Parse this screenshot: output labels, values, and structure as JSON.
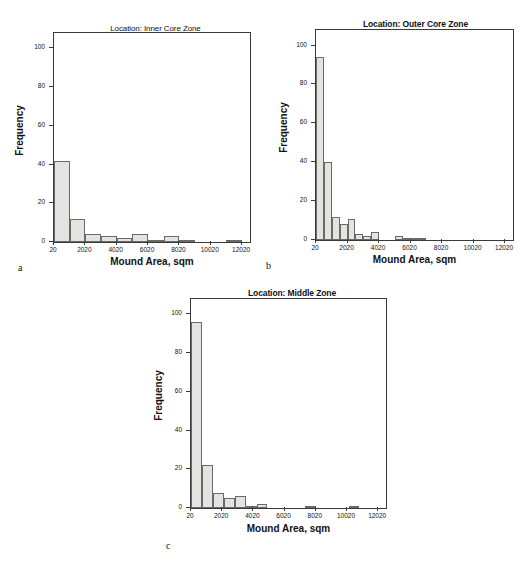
{
  "figure": {
    "axis_labels": {
      "x": "Mound Area, sqm",
      "y": "Frequency"
    },
    "panel_letters": {
      "a": "a",
      "b": "b",
      "c": "c"
    }
  },
  "chart_data": [
    {
      "type": "bar",
      "panel": "a",
      "title": "Location: Inner Core Zone",
      "xlabel": "Mound Area, sqm",
      "ylabel": "Frequency",
      "xlim": [
        20,
        12520
      ],
      "ylim": [
        0,
        108
      ],
      "xticks": [
        20,
        2020,
        4020,
        6020,
        8020,
        10020,
        12020
      ],
      "xtick_labels": [
        "20",
        "2020",
        "4020",
        "6020",
        "8020",
        "10020",
        "12020"
      ],
      "yticks": [
        0,
        20,
        40,
        60,
        80,
        100
      ],
      "ytick_labels": [
        "0",
        "20",
        "40",
        "60",
        "80",
        "100"
      ],
      "grid": false,
      "legend": "none",
      "bin_width": 1000,
      "bins": [
        {
          "x0": 20,
          "x1": 1020,
          "value": 42
        },
        {
          "x0": 1020,
          "x1": 2020,
          "value": 12
        },
        {
          "x0": 2020,
          "x1": 3020,
          "value": 4
        },
        {
          "x0": 3020,
          "x1": 4020,
          "value": 3
        },
        {
          "x0": 4020,
          "x1": 5020,
          "value": 2
        },
        {
          "x0": 5020,
          "x1": 6020,
          "value": 4
        },
        {
          "x0": 6020,
          "x1": 7020,
          "value": 1
        },
        {
          "x0": 7020,
          "x1": 8020,
          "value": 3
        },
        {
          "x0": 8020,
          "x1": 9020,
          "value": 1
        },
        {
          "x0": 9020,
          "x1": 10020,
          "value": 0
        },
        {
          "x0": 10020,
          "x1": 11020,
          "value": 0
        },
        {
          "x0": 11020,
          "x1": 12020,
          "value": 1
        }
      ]
    },
    {
      "type": "bar",
      "panel": "b",
      "title": "Location: Outer Core Zone",
      "xlabel": "Mound Area, sqm",
      "ylabel": "Frequency",
      "xlim": [
        20,
        12520
      ],
      "ylim": [
        0,
        108
      ],
      "xticks": [
        20,
        2020,
        4020,
        6020,
        8020,
        10020,
        12020
      ],
      "xtick_labels": [
        "20",
        "2020",
        "4020",
        "6020",
        "8020",
        "10020",
        "12020"
      ],
      "yticks": [
        0,
        20,
        40,
        60,
        80,
        100
      ],
      "ytick_labels": [
        "0",
        "20",
        "40",
        "60",
        "80",
        "100"
      ],
      "grid": false,
      "legend": "none",
      "bin_width": 500,
      "bins": [
        {
          "x0": 20,
          "x1": 520,
          "value": 94
        },
        {
          "x0": 520,
          "x1": 1020,
          "value": 40
        },
        {
          "x0": 1020,
          "x1": 1520,
          "value": 12
        },
        {
          "x0": 1520,
          "x1": 2020,
          "value": 8
        },
        {
          "x0": 2020,
          "x1": 2520,
          "value": 11
        },
        {
          "x0": 2520,
          "x1": 3020,
          "value": 3
        },
        {
          "x0": 3020,
          "x1": 3520,
          "value": 2
        },
        {
          "x0": 3520,
          "x1": 4020,
          "value": 4
        },
        {
          "x0": 4020,
          "x1": 4520,
          "value": 0
        },
        {
          "x0": 4520,
          "x1": 5020,
          "value": 0
        },
        {
          "x0": 5020,
          "x1": 5520,
          "value": 2
        },
        {
          "x0": 5520,
          "x1": 6020,
          "value": 1
        },
        {
          "x0": 6020,
          "x1": 6520,
          "value": 1
        },
        {
          "x0": 6520,
          "x1": 7020,
          "value": 1
        }
      ]
    },
    {
      "type": "bar",
      "panel": "c",
      "title": "Location: Middle Zone",
      "xlabel": "Mound Area, sqm",
      "ylabel": "Frequency",
      "xlim": [
        20,
        12520
      ],
      "ylim": [
        0,
        108
      ],
      "xticks": [
        20,
        2020,
        4020,
        6020,
        8020,
        10020,
        12020
      ],
      "xtick_labels": [
        "20",
        "2020",
        "4020",
        "6020",
        "8020",
        "10020",
        "12020"
      ],
      "yticks": [
        0,
        20,
        40,
        60,
        80,
        100
      ],
      "ytick_labels": [
        "0",
        "20",
        "40",
        "60",
        "80",
        "100"
      ],
      "grid": false,
      "legend": "none",
      "bin_width": 700,
      "bins": [
        {
          "x0": 20,
          "x1": 720,
          "value": 96
        },
        {
          "x0": 720,
          "x1": 1420,
          "value": 22
        },
        {
          "x0": 1420,
          "x1": 2120,
          "value": 8
        },
        {
          "x0": 2120,
          "x1": 2820,
          "value": 5
        },
        {
          "x0": 2820,
          "x1": 3520,
          "value": 6
        },
        {
          "x0": 3520,
          "x1": 4220,
          "value": 1
        },
        {
          "x0": 4220,
          "x1": 4920,
          "value": 2
        },
        {
          "x0": 7320,
          "x1": 8020,
          "value": 1
        },
        {
          "x0": 10120,
          "x1": 10820,
          "value": 1
        }
      ]
    }
  ]
}
